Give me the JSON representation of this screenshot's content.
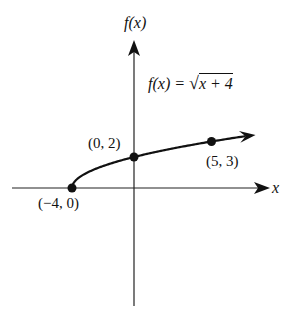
{
  "chart_data": {
    "type": "line",
    "title": "",
    "function_label": "f(x) = √(x + 4)",
    "function_lhs": "f(x) =",
    "function_radicand": "x + 4",
    "xlabel": "x",
    "ylabel": "f(x)",
    "grid": false,
    "points": [
      {
        "x": -4,
        "y": 0,
        "label": "(−4, 0)"
      },
      {
        "x": 0,
        "y": 2,
        "label": "(0, 2)"
      },
      {
        "x": 5,
        "y": 3,
        "label": "(5, 3)"
      }
    ],
    "curve": {
      "x_start": -4,
      "x_end": 7.2,
      "arrow_end": true
    },
    "axes": {
      "x_arrow": true,
      "y_arrow": true
    }
  }
}
